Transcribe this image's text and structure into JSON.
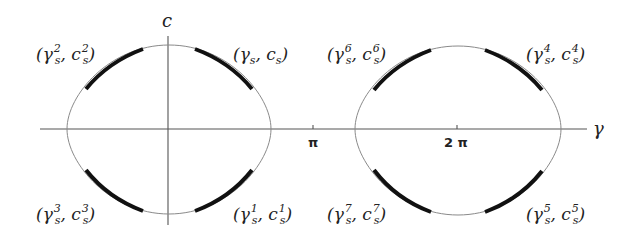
{
  "axes": {
    "x_label": "γ",
    "y_label": "c",
    "ticks": [
      {
        "label": "π",
        "x": 313
      },
      {
        "label": "2 π",
        "x": 457
      }
    ]
  },
  "labels": {
    "upper_left_1": {
      "base": "(γ",
      "sup1": "2",
      "sub1": "s",
      "mid": ", c",
      "sup2": "2",
      "sub2": "s",
      "end": ")"
    },
    "upper_right_1": {
      "base": "(γ",
      "sup1": "",
      "sub1": "s",
      "mid": ", c",
      "sup2": "",
      "sub2": "s",
      "end": ")"
    },
    "lower_left_1": {
      "base": "(γ",
      "sup1": "3",
      "sub1": "s",
      "mid": ", c",
      "sup2": "3",
      "sub2": "s",
      "end": ")"
    },
    "lower_right_1": {
      "base": "(γ",
      "sup1": "1",
      "sub1": "s",
      "mid": ", c",
      "sup2": "1",
      "sub2": "s",
      "end": ")"
    },
    "upper_left_2": {
      "base": "(γ",
      "sup1": "6",
      "sub1": "s",
      "mid": ", c",
      "sup2": "6",
      "sub2": "s",
      "end": ")"
    },
    "upper_right_2": {
      "base": "(γ",
      "sup1": "4",
      "sub1": "s",
      "mid": ", c",
      "sup2": "4",
      "sub2": "s",
      "end": ")"
    },
    "lower_left_2": {
      "base": "(γ",
      "sup1": "7",
      "sub1": "s",
      "mid": ", c",
      "sup2": "7",
      "sub2": "s",
      "end": ")"
    },
    "lower_right_2": {
      "base": "(γ",
      "sup1": "5",
      "sub1": "s",
      "mid": ", c",
      "sup2": "5",
      "sub2": "s",
      "end": ")"
    }
  },
  "colors": {
    "thin_curve": "#8a8a8a",
    "bold_arc": "#111111",
    "axis": "#555555"
  }
}
